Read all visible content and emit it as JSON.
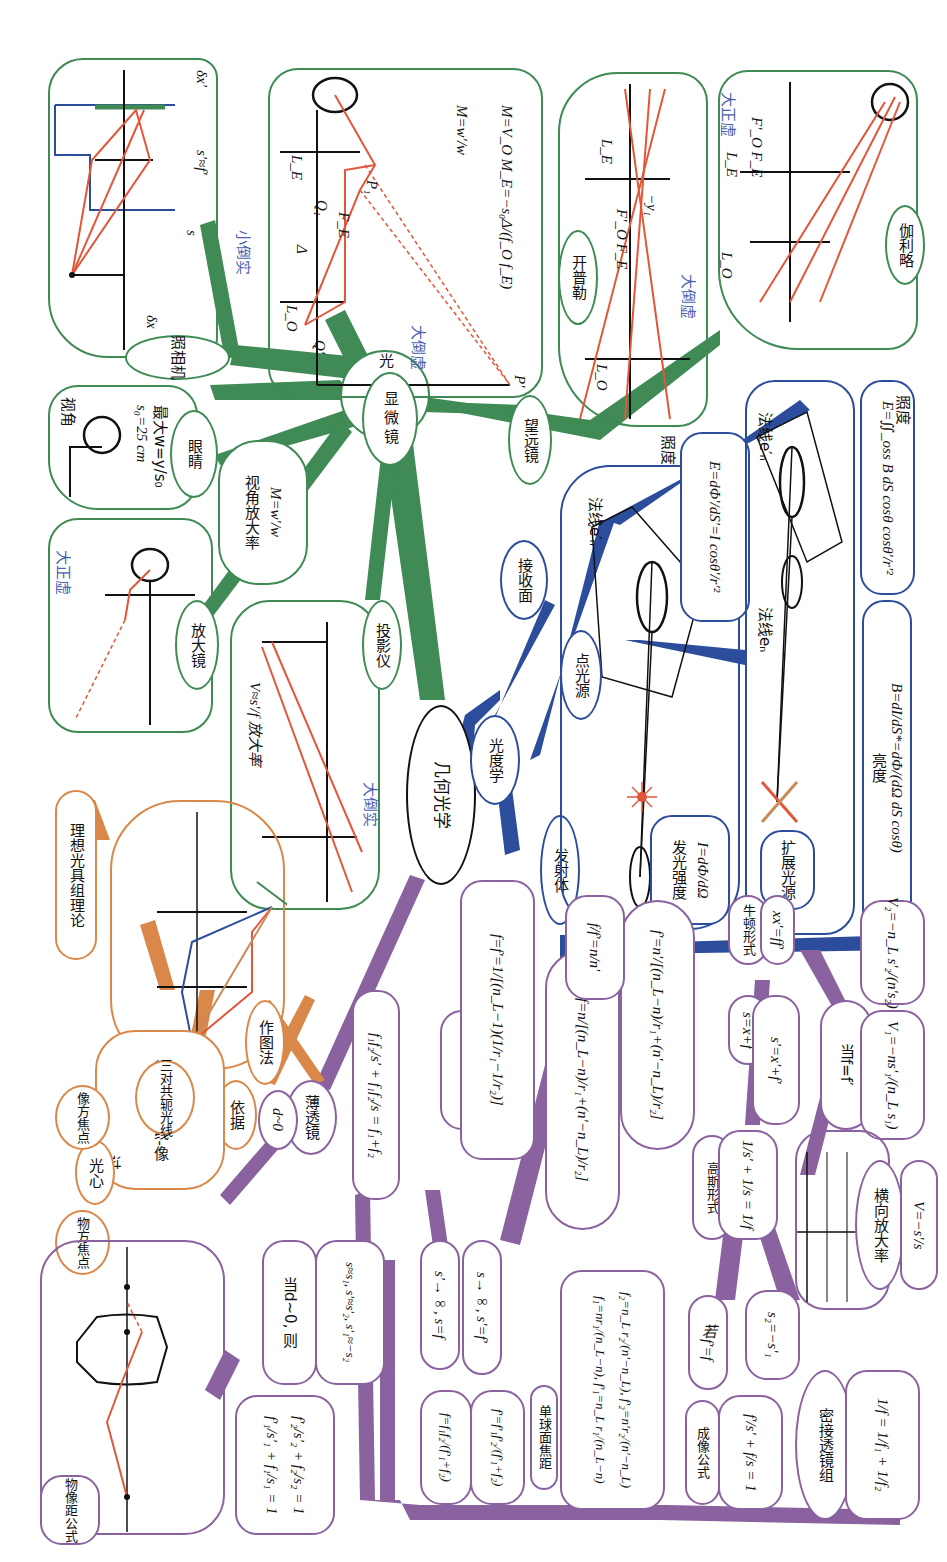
{
  "colors": {
    "instruments_branch": "#3f8a55",
    "photometry_branch": "#2c4d9c",
    "thin_lens_branch": "#8a62a0",
    "ideal_system_branch": "#d9884a",
    "ray_red": "#e2563a",
    "annotation_blue": "#4a5fae",
    "root_border": "#111111"
  },
  "root": {
    "label": "几何光学"
  },
  "instruments": {
    "hub": "光学仪器",
    "camera": {
      "label": "照相机",
      "image_type": "小倒实",
      "symbols": {
        "s": "s",
        "s_prime": "s′≈f′",
        "dx": "δx",
        "dx_prime": "δx′"
      }
    },
    "microscope": {
      "label": "显微镜",
      "image_type": "大倒虚",
      "formula_1": "M=w′/w",
      "formula_2": "M=V_O M_E=−s₀Δ/(f_O f_E)",
      "symbols": [
        "L_E",
        "L_O",
        "Q₁",
        "P₁",
        "F_E",
        "F_O",
        "Δ",
        "P",
        "Q",
        "Q′",
        "P′",
        "w",
        "w′"
      ]
    },
    "keplerian": {
      "label": "开普勒",
      "image_type": "大倒虚",
      "symbols": [
        "L_O",
        "L_E",
        "F′_O F_E",
        "−y₁",
        "w",
        "−w′"
      ]
    },
    "galilean": {
      "label": "伽利略",
      "image_type": "大正虚",
      "symbols": [
        "L_O",
        "L_E",
        "F′_O F_E",
        "−y₁",
        "w",
        "w′"
      ]
    },
    "telescope": {
      "label": "望远镜"
    },
    "eye": {
      "label": "眼睛",
      "visual_angle_title": "视角",
      "s0": "s₀=25 cm",
      "max_w": "最大w=y/s₀",
      "symbols": [
        "y",
        "w"
      ]
    },
    "angular_magnification": {
      "label": "视角放大率",
      "formula": "M=w′/w"
    },
    "magnifier": {
      "label": "放大镜",
      "image_type": "大正虚",
      "symbols": [
        "P",
        "y",
        "F",
        "Q",
        "w′",
        "P′",
        "Q′"
      ]
    },
    "projector": {
      "label": "投影仪",
      "image_type": "大倒实",
      "formula": "V≈s′/f 放大率",
      "symbols": [
        "s≈f",
        "L",
        "F′",
        "s′",
        "P′"
      ]
    }
  },
  "photometry": {
    "hub": "光度学",
    "emitter": "发射体",
    "receiver": "接收面",
    "point_source": {
      "label": "点光源",
      "intensity_label": "发光强度",
      "intensity_formula": "I=dΦ/dΩ",
      "normal": "法线e′ₙ",
      "symbols": [
        "dΩ",
        "dS′",
        "θ′",
        "r′",
        "r"
      ]
    },
    "illuminance_point": {
      "label": "照度",
      "formula": "E=dΦ′/dS′=I cosθ′/r′²"
    },
    "extended_source": {
      "label": "扩展光源",
      "normal_1": "法线eₙ",
      "normal_2": "法线e′ₙ",
      "symbols": [
        "dS",
        "dS*",
        "θ",
        "dΩ",
        "r′",
        "θ′",
        "dS′"
      ]
    },
    "brightness": {
      "label": "亮度",
      "formula": "B=dI/dS*=dΦ/(dΩ dS cosθ)"
    },
    "illuminance_extended": {
      "label": "照度",
      "formula": "E=∬_oss B dS cosθ cosθ′/r′²"
    }
  },
  "ideal_system": {
    "title": "理想光具组理论",
    "construction": "作图法",
    "basis": "依据",
    "conjugate": "物-共轭光线-像",
    "three_pairs": "三对共轭光线",
    "through": "过",
    "obj_focus": "物方焦点",
    "optical_center": "光心",
    "img_focus": "像方焦点",
    "symbols": [
      "L₁",
      "L₂",
      "P",
      "Q",
      "F₁",
      "F′₂",
      "F′₁",
      "P₁",
      "Q′",
      "P′",
      "F₂"
    ]
  },
  "thin_lens": {
    "label": "薄透镜",
    "d_approx": "d~0",
    "combined_formula": "f₁f₂/s′ + f₁f₂/s = f₁+f₂",
    "lensmaker_label": "磨镜者公式",
    "lensmaker_formula": "f=f′=1/[(n_L−1)(1/r₁−1/r₂)]",
    "f_formula": "f=n/[(n_L−n)/r₁+(n′−n_L)/r₂]",
    "f_prime_formula": "f′=n′/[(n_L−n)/r₁+(n′−n_L)/r₂]",
    "ratio": "f/f′=n/n′",
    "object_image_distance": {
      "label": "物像距公式",
      "symbols": [
        "n",
        "n_L",
        "n′",
        "Σ₁",
        "Σ₂",
        "A₁",
        "A₂",
        "Q",
        "Q′",
        "Q₁",
        "s₁",
        "d",
        "s′₁",
        "s₂",
        "s′₂"
      ],
      "eq1": "f′₁/s′₁ + f₁/s₁ = 1",
      "eq2": "f′₂/s′₂ + f₂/s₂ = 1"
    },
    "when_d_zero": "当d~0, 则",
    "approx": "s≈s₁, s′≈s′₂, s′₁≈−s₂",
    "focal_f": "f=f₁f₂/(f′₁+f₂)",
    "focal_f_prime": "f′=f′₁f′₂/(f′₁+f₂)",
    "s_prime_inf": "s′→∞, s=f",
    "s_inf": "s→∞, s′=f′",
    "single_surface": {
      "label": "单球面焦距",
      "line1": "f₁=nr₁/(n_L−n), f′₁=n_L r₁/(n_L−n)",
      "line2": "f₂=n_L r₂/(n′−n_L), f′₂=n′r₂/(n′−n_L)"
    },
    "imaging_formula": {
      "label": "成像公式",
      "formula": "f′/s′ + f/s = 1"
    },
    "if_equal": "若f′=f",
    "gaussian": {
      "label": "高斯形式",
      "formula": "1/s′ + 1/s = 1/f"
    },
    "s_eq": "s=x+f",
    "s_prime_eq": "s′=x′+f′",
    "newton": {
      "label": "牛顿形式",
      "formula": "xx′=ff′"
    },
    "when_eq": "当f=f′",
    "v1": "V₁=−ns′₁/(n_L s₁)",
    "v2": "V₂=−n_L s′₂/(n′s₂)",
    "lateral": {
      "label": "横向放大率",
      "formula": "V=−s′/s",
      "axis_labels": [
        "Q",
        "F",
        "O",
        "F′",
        "Q′",
        "x",
        "f",
        "s",
        "f′",
        "s′",
        "x′"
      ]
    },
    "s2_eq": "s₂=−s′₁",
    "contact": {
      "label": "密接透镜组",
      "formula": "1/f = 1/f₁ + 1/f₂"
    }
  }
}
